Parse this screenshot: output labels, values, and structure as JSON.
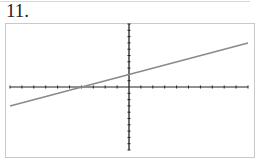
{
  "problem_label": "11.",
  "chart_data": {
    "type": "line",
    "title": "",
    "xlabel": "",
    "ylabel": "",
    "xlim": [
      -10,
      10
    ],
    "ylim": [
      -10,
      10
    ],
    "x_tick_step": 1,
    "y_tick_step": 1,
    "grid": false,
    "legend": null,
    "series": [
      {
        "name": "y = 0.5x + 2",
        "equation": "y = 0.5x + 2",
        "slope": 0.5,
        "intercept": 2,
        "x": [
          -10,
          -4,
          0,
          10
        ],
        "y": [
          -3,
          0,
          2,
          7
        ],
        "color": "#8a8a8a"
      }
    ]
  },
  "colors": {
    "axis": "#222222",
    "line": "#8a8a8a",
    "frame": "#c9c9c9"
  }
}
